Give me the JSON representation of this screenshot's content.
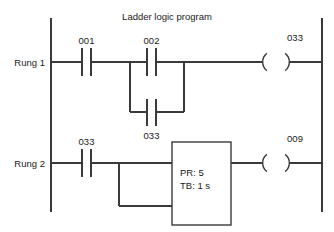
{
  "diagram": {
    "title": "Ladder logic program",
    "type": "ladder-logic",
    "rungs": [
      {
        "name": "Rung 1",
        "label": "Rung 1",
        "series_contact": {
          "address": "001",
          "type": "normally-open"
        },
        "parallel_branch": [
          {
            "address": "002",
            "type": "normally-open"
          },
          {
            "address": "033",
            "type": "normally-open"
          }
        ],
        "output": {
          "address": "033",
          "type": "coil"
        }
      },
      {
        "name": "Rung 2",
        "label": "Rung 2",
        "series_contact": {
          "address": "033",
          "type": "normally-open"
        },
        "timer": {
          "preset_label": "PR: 5",
          "timebase_label": "TB: 1 s",
          "preset_value": "5",
          "timebase_value": "1 s"
        },
        "output": {
          "address": "009",
          "type": "coil"
        }
      }
    ]
  },
  "labels": {
    "title": "Ladder logic program",
    "rung1": "Rung 1",
    "rung2": "Rung 2",
    "addr_001": "001",
    "addr_002": "002",
    "addr_033_branch": "033",
    "addr_033_coil": "033",
    "addr_033_rung2": "033",
    "addr_009": "009",
    "timer_pr": "PR: 5",
    "timer_tb": "TB: 1 s"
  },
  "colors": {
    "line": "#3a3a3a",
    "text": "#1a1a1a",
    "background": "#ffffff"
  }
}
